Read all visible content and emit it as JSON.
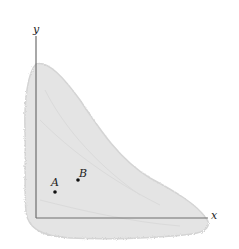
{
  "figure": {
    "colors": {
      "background": "#ffffff",
      "region_fill": "#e4e4e4",
      "region_edge": "#d2d2d2",
      "axis": "#6e6e6e",
      "point": "#111111"
    },
    "axes": {
      "x_label": "x",
      "y_label": "y"
    },
    "points": [
      {
        "label": "A",
        "px": 55,
        "py": 192
      },
      {
        "label": "B",
        "px": 78,
        "py": 180
      }
    ]
  }
}
